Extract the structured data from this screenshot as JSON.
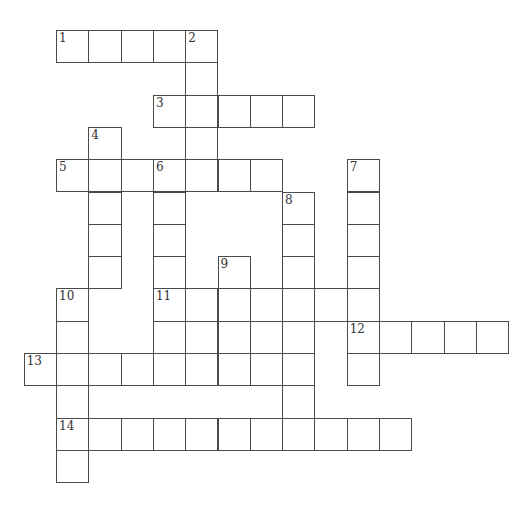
{
  "puzzle": {
    "type": "crossword",
    "cell_size_px": 32.3,
    "origin": {
      "x": 56,
      "y": 30
    },
    "clues": [
      {
        "number": 1,
        "direction": "across",
        "row": 0,
        "col": 0,
        "length": 5
      },
      {
        "number": 2,
        "direction": "down",
        "row": 0,
        "col": 4,
        "length": 5
      },
      {
        "number": 3,
        "direction": "across",
        "row": 2,
        "col": 3,
        "length": 5
      },
      {
        "number": 4,
        "direction": "down",
        "row": 3,
        "col": 1,
        "length": 5
      },
      {
        "number": 5,
        "direction": "across",
        "row": 4,
        "col": 0,
        "length": 7
      },
      {
        "number": 6,
        "direction": "down",
        "row": 4,
        "col": 3,
        "length": 7
      },
      {
        "number": 7,
        "direction": "down",
        "row": 4,
        "col": 9,
        "length": 7
      },
      {
        "number": 8,
        "direction": "down",
        "row": 5,
        "col": 7,
        "length": 8
      },
      {
        "number": 9,
        "direction": "down",
        "row": 7,
        "col": 5,
        "length": 4
      },
      {
        "number": 10,
        "direction": "down",
        "row": 8,
        "col": 0,
        "length": 6
      },
      {
        "number": 11,
        "direction": "across",
        "row": 8,
        "col": 3,
        "length": 7
      },
      {
        "number": 12,
        "direction": "across",
        "row": 9,
        "col": 9,
        "length": 5
      },
      {
        "number": 13,
        "direction": "across",
        "row": 10,
        "col": -1,
        "length": 8
      },
      {
        "number": 14,
        "direction": "across",
        "row": 12,
        "col": 0,
        "length": 11
      }
    ],
    "extra_cells": [
      {
        "row": 9,
        "col": 4
      }
    ]
  }
}
